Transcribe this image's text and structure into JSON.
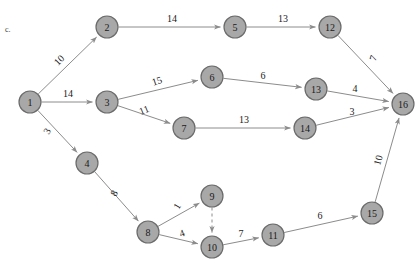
{
  "figure": {
    "part_label": "c.",
    "width": 416,
    "height": 262,
    "background_color": "#ffffff",
    "node_fill_color": "#a8a8a8",
    "node_stroke_color": "#6b6b6b",
    "edge_color": "#8c8c8c",
    "label_color": "#1a1a1a"
  },
  "chart_data": {
    "type": "diagram",
    "diagram_kind": "directed-weighted-graph",
    "title": "",
    "nodes": [
      {
        "id": "1",
        "label": "1",
        "x": 30,
        "y": 102
      },
      {
        "id": "2",
        "label": "2",
        "x": 107,
        "y": 27
      },
      {
        "id": "3",
        "label": "3",
        "x": 107,
        "y": 102
      },
      {
        "id": "4",
        "label": "4",
        "x": 87,
        "y": 163
      },
      {
        "id": "5",
        "label": "5",
        "x": 235,
        "y": 27
      },
      {
        "id": "6",
        "label": "6",
        "x": 212,
        "y": 77
      },
      {
        "id": "7",
        "label": "7",
        "x": 184,
        "y": 128
      },
      {
        "id": "8",
        "label": "8",
        "x": 148,
        "y": 232
      },
      {
        "id": "9",
        "label": "9",
        "x": 212,
        "y": 196
      },
      {
        "id": "10",
        "label": "10",
        "x": 212,
        "y": 247
      },
      {
        "id": "11",
        "label": "11",
        "x": 273,
        "y": 235
      },
      {
        "id": "12",
        "label": "12",
        "x": 330,
        "y": 27
      },
      {
        "id": "13",
        "label": "13",
        "x": 316,
        "y": 89
      },
      {
        "id": "14",
        "label": "14",
        "x": 305,
        "y": 128
      },
      {
        "id": "15",
        "label": "15",
        "x": 372,
        "y": 213
      },
      {
        "id": "16",
        "label": "16",
        "x": 403,
        "y": 104
      }
    ],
    "node_radius": 11,
    "edges": [
      {
        "from": "1",
        "to": "2",
        "weight": "10",
        "label_x": 59,
        "label_y": 60,
        "rotation": -45,
        "style": "solid"
      },
      {
        "from": "1",
        "to": "3",
        "weight": "14",
        "label_x": 68,
        "label_y": 93,
        "rotation": 0,
        "style": "solid"
      },
      {
        "from": "1",
        "to": "4",
        "weight": "3",
        "label_x": 47,
        "label_y": 131,
        "rotation": -60,
        "style": "solid"
      },
      {
        "from": "2",
        "to": "5",
        "weight": "14",
        "label_x": 172,
        "label_y": 18,
        "rotation": 0,
        "style": "solid"
      },
      {
        "from": "3",
        "to": "6",
        "weight": "15",
        "label_x": 157,
        "label_y": 81,
        "rotation": -18,
        "style": "solid"
      },
      {
        "from": "3",
        "to": "7",
        "weight": "11",
        "label_x": 144,
        "label_y": 110,
        "rotation": -22,
        "style": "solid"
      },
      {
        "from": "4",
        "to": "8",
        "weight": "8",
        "label_x": 114,
        "label_y": 193,
        "rotation": -60,
        "style": "solid"
      },
      {
        "from": "5",
        "to": "12",
        "weight": "13",
        "label_x": 283,
        "label_y": 18,
        "rotation": 0,
        "style": "solid"
      },
      {
        "from": "6",
        "to": "13",
        "weight": "6",
        "label_x": 263,
        "label_y": 75,
        "rotation": 0,
        "style": "solid"
      },
      {
        "from": "7",
        "to": "14",
        "weight": "13",
        "label_x": 244,
        "label_y": 119,
        "rotation": 0,
        "style": "solid"
      },
      {
        "from": "8",
        "to": "9",
        "weight": "1",
        "label_x": 177,
        "label_y": 206,
        "rotation": -60,
        "style": "solid"
      },
      {
        "from": "8",
        "to": "10",
        "weight": "4",
        "label_x": 182,
        "label_y": 233,
        "rotation": -20,
        "style": "solid"
      },
      {
        "from": "9",
        "to": "10",
        "weight": "",
        "label_x": 0,
        "label_y": 0,
        "rotation": 0,
        "style": "dashed"
      },
      {
        "from": "10",
        "to": "11",
        "weight": "7",
        "label_x": 241,
        "label_y": 233,
        "rotation": 0,
        "style": "solid"
      },
      {
        "from": "11",
        "to": "15",
        "weight": "6",
        "label_x": 320,
        "label_y": 215,
        "rotation": 0,
        "style": "solid"
      },
      {
        "from": "12",
        "to": "16",
        "weight": "7",
        "label_x": 373,
        "label_y": 58,
        "rotation": -70,
        "style": "solid"
      },
      {
        "from": "13",
        "to": "16",
        "weight": "4",
        "label_x": 355,
        "label_y": 88,
        "rotation": 0,
        "style": "solid"
      },
      {
        "from": "14",
        "to": "16",
        "weight": "3",
        "label_x": 352,
        "label_y": 111,
        "rotation": 0,
        "style": "solid"
      },
      {
        "from": "15",
        "to": "16",
        "weight": "10",
        "label_x": 378,
        "label_y": 160,
        "rotation": -75,
        "style": "solid"
      }
    ]
  }
}
